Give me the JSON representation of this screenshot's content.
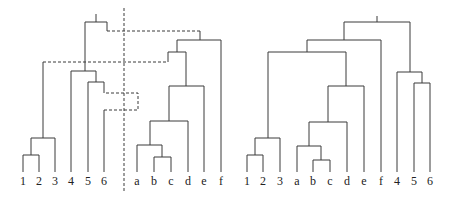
{
  "left_panel": {
    "leaf_labels": [
      "1",
      "2",
      "3",
      "4",
      "5",
      "6",
      "a",
      "b",
      "c",
      "d",
      "e",
      "f"
    ],
    "divider": "dashed-vertical-separator"
  },
  "right_panel": {
    "leaf_labels": [
      "1",
      "2",
      "3",
      "a",
      "b",
      "c",
      "d",
      "e",
      "f",
      "4",
      "5",
      "6"
    ]
  },
  "colors": {
    "line": "#3a3a3a",
    "text": "#222222",
    "background": "#ffffff"
  }
}
